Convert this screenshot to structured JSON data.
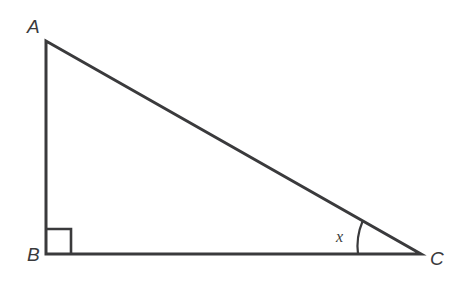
{
  "figure": {
    "type": "geometry-diagram",
    "shape": "right-triangle",
    "background_color": "#ffffff",
    "stroke_color": "#3a3a3c",
    "stroke_width": 3,
    "width": 460,
    "height": 284
  },
  "labels": {
    "vertex_a": "A",
    "vertex_b": "B",
    "vertex_c": "C",
    "angle_x": "x"
  },
  "geometry": {
    "vertices": {
      "A": {
        "x": 46,
        "y": 41
      },
      "B": {
        "x": 46,
        "y": 254
      },
      "C": {
        "x": 421,
        "y": 254
      }
    },
    "sides": [
      {
        "name": "AB",
        "from": "A",
        "to": "B",
        "role": "vertical-leg"
      },
      {
        "name": "BC",
        "from": "B",
        "to": "C",
        "role": "horizontal-leg"
      },
      {
        "name": "AC",
        "from": "A",
        "to": "C",
        "role": "hypotenuse"
      }
    ],
    "right_angle_marker": {
      "at_vertex": "B",
      "size": 25,
      "x": 46,
      "y": 229
    },
    "angle_arc": {
      "at_vertex": "C",
      "label": "x",
      "radius": 63,
      "start": {
        "x": 358,
        "y": 254
      },
      "end": {
        "x": 362,
        "y": 221
      }
    }
  },
  "paths": {
    "triangle": "M 46 41 L 46 254 L 421 254 Z",
    "right_angle": "M 46 229 L 71 229 L 71 254",
    "arc": "M 358 254 A 63 63 0 0 1 362.5 221.5"
  }
}
